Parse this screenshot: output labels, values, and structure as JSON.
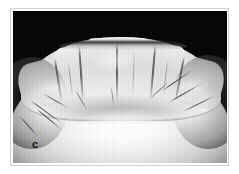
{
  "figure": {
    "panel_label": "c",
    "caption": "",
    "media_type": "photograph",
    "background_color": "#030303",
    "frame_color": "#cfcfcf",
    "page_color": "#ffffff",
    "label_color": "#101010"
  },
  "photo": {
    "cast_highlight_color": "#ffffff",
    "cast_midtone_color": "#e2e2e2",
    "cast_shadow_color": "#9a9a9a",
    "groove_color": "#373737",
    "crack_color": "#3a3a3a",
    "teeth_count": 6,
    "teeth": [
      {
        "name": "right-canine",
        "label": ""
      },
      {
        "name": "right-lateral-incisor",
        "label": ""
      },
      {
        "name": "right-central-incisor",
        "label": ""
      },
      {
        "name": "left-central-incisor",
        "label": ""
      },
      {
        "name": "left-lateral-incisor",
        "label": ""
      },
      {
        "name": "left-canine",
        "label": ""
      }
    ]
  }
}
